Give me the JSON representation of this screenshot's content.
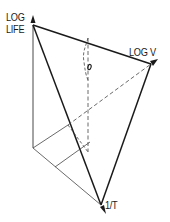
{
  "diagram": {
    "type": "3d-axis-schematic",
    "axes": {
      "vertical": {
        "label_line1": "LOG",
        "label_line2": "LIFE"
      },
      "right": {
        "label": "LOG V"
      },
      "forward": {
        "label": "1/T"
      }
    },
    "colors": {
      "line": "#1a1a1a",
      "thin_line": "#555555",
      "background": "#ffffff"
    }
  }
}
